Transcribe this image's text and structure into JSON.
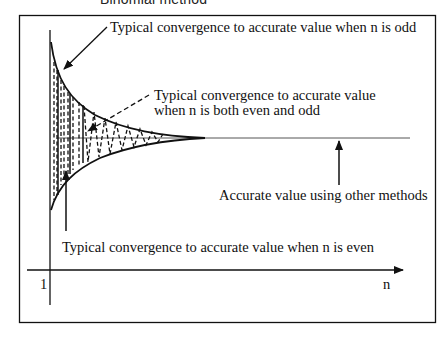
{
  "title": "Binomial method",
  "labels": {
    "odd": "Typical convergence to accurate value when n is odd",
    "both_line1": "Typical convergence to accurate value",
    "both_line2": "when n is both even and odd",
    "accurate": "Accurate value using other methods",
    "even": "Typical convergence to accurate value when n is even"
  },
  "axes": {
    "x_start_label": "1",
    "x_label": "n"
  },
  "colors": {
    "ink": "#111111",
    "background": "#ffffff"
  }
}
